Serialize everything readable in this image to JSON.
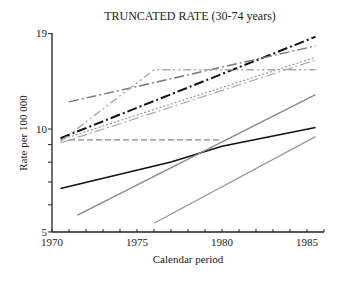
{
  "chart_data": {
    "type": "line",
    "title": "TRUNCATED RATE (30-74 years)",
    "xlabel": "Calendar period",
    "ylabel": "Rate per 100 000",
    "xlim": [
      1970,
      1986
    ],
    "ylim": [
      5,
      19
    ],
    "y_scale": "log",
    "x_ticks": [
      1970,
      1975,
      1980,
      1985
    ],
    "y_ticks": [
      5,
      10,
      19
    ],
    "y_minor_ticks": [
      6,
      7,
      8,
      9
    ],
    "grid": false,
    "legend": null,
    "series": [
      {
        "name": "black dash-dot",
        "color": "#111111",
        "dash": "10,3,2,3",
        "width": 2,
        "points": [
          [
            1970.5,
            9.4
          ],
          [
            1985.5,
            18.6
          ]
        ]
      },
      {
        "name": "gray dash-dot upper",
        "color": "#777777",
        "dash": "10,3,2,3",
        "width": 1.4,
        "points": [
          [
            1971,
            12.0
          ],
          [
            1985.5,
            17.5
          ]
        ]
      },
      {
        "name": "light gray dash-dot-dot steep",
        "color": "#aaaaaa",
        "dash": "8,3,2,3,2,3",
        "width": 1.4,
        "points": [
          [
            1970.5,
            9.2
          ],
          [
            1976,
            14.9
          ],
          [
            1985.5,
            14.9
          ]
        ]
      },
      {
        "name": "light dotted",
        "color": "#999999",
        "dash": "2,2",
        "width": 1.2,
        "points": [
          [
            1970.5,
            9.3
          ],
          [
            1985.5,
            16.2
          ]
        ]
      },
      {
        "name": "light gray dash-dot lower",
        "color": "#aaaaaa",
        "dash": "10,3,2,3",
        "width": 1.2,
        "points": [
          [
            1970.5,
            9.1
          ],
          [
            1985.5,
            15.9
          ]
        ]
      },
      {
        "name": "gray dashed flat",
        "color": "#888888",
        "dash": "6,3",
        "width": 1.2,
        "points": [
          [
            1971,
            9.3
          ],
          [
            1980,
            9.3
          ]
        ]
      },
      {
        "name": "black solid",
        "color": "#111111",
        "dash": "",
        "width": 1.6,
        "points": [
          [
            1970.5,
            6.7
          ],
          [
            1977,
            8.0
          ],
          [
            1980,
            8.9
          ],
          [
            1985.5,
            10.1
          ]
        ]
      },
      {
        "name": "gray solid",
        "color": "#888888",
        "dash": "",
        "width": 1.3,
        "points": [
          [
            1971.5,
            5.6
          ],
          [
            1985.5,
            12.6
          ]
        ]
      },
      {
        "name": "gray solid lower",
        "color": "#999999",
        "dash": "",
        "width": 1.3,
        "points": [
          [
            1976,
            5.3
          ],
          [
            1985.5,
            9.5
          ]
        ]
      }
    ]
  },
  "labels": {
    "title": "TRUNCATED RATE (30-74 years)",
    "xlabel": "Calendar period",
    "ylabel": "Rate per 100 000",
    "x_tick_labels": [
      "1970",
      "1975",
      "1980",
      "1985"
    ],
    "y_tick_labels": [
      "5",
      "10",
      "19"
    ]
  }
}
